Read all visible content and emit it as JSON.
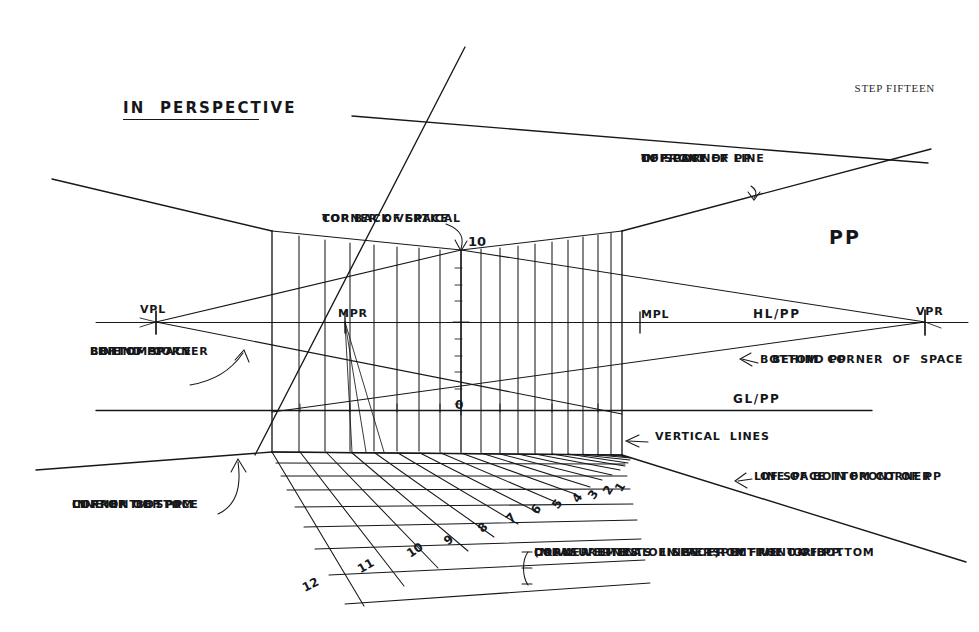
{
  "sheet": {
    "title": "IN  PERSPECTIVE",
    "step_label": "STEP FIFTEEN",
    "background_color": "#ffffff",
    "ink_color": "#15171a"
  },
  "points": {
    "vpl": {
      "label": "VPL",
      "x": 155,
      "y": 322
    },
    "vpr": {
      "label": "VPR",
      "x": 925,
      "y": 322
    },
    "mpr": {
      "label": "MPR",
      "x": 345,
      "y": 322
    },
    "mpl": {
      "label": "MPL",
      "x": 640,
      "y": 322
    }
  },
  "lines": {
    "horizon": {
      "label": "HL/PP",
      "y": 322
    },
    "ground": {
      "label": "GL/PP",
      "y": 410
    },
    "picture_plane": {
      "label": "PP"
    }
  },
  "measuring_line": {
    "top_value": "10",
    "bottom_value": "0",
    "x": 461,
    "top_y": 250,
    "bottom_y": 415
  },
  "annotations": [
    {
      "name": "top-back-vertical-corner",
      "lines": [
        "TOP BACK VERTICAL",
        "CORNER OF SPACE"
      ],
      "target_value": "10"
    },
    {
      "name": "top-corner-line-front-pp",
      "lines": [
        "TOP CORNER LINE",
        "OF SPACE",
        "IN FRONT OF PP"
      ]
    },
    {
      "name": "bottom-corner-line-behind-pp-left",
      "lines": [
        "BOTTOM CORNER",
        "LINE OF SPACE",
        "BEHIND PP"
      ]
    },
    {
      "name": "bottom-corner-space-behind-pp-right",
      "lines": [
        "BOTTOM  CORNER  OF  SPACE",
        "BEHIND PP"
      ]
    },
    {
      "name": "vertical-lines",
      "lines": [
        "VERTICAL  LINES"
      ]
    },
    {
      "name": "line-of-bottom-corner-front-pp-right",
      "lines": [
        "LINE OF BOTTOM CORNER",
        "OF SPACE IN FRONT OF PP"
      ]
    },
    {
      "name": "line-of-bottom-corner-front-pp-left",
      "lines": [
        "LINE OF  BOTTOM",
        "CORNER OF SPACE",
        "IN FRONT OF PP"
      ]
    }
  ],
  "instruction": {
    "lines": [
      "DRAW  VERTICAL  LINES  FROM  THE  GRID",
      "(MEASUREMENTS  IN  PERSPECTIVE  ON  BOTTOM",
      "CORNER  LINES  OF SPACE)  IN FRONT OF PP."
    ]
  },
  "grid_numbers": [
    {
      "value": "1",
      "x": 612,
      "y": 487,
      "rot": -58
    },
    {
      "value": "2",
      "x": 600,
      "y": 490,
      "rot": -58
    },
    {
      "value": "3",
      "x": 585,
      "y": 494,
      "rot": -56
    },
    {
      "value": "4",
      "x": 569,
      "y": 497,
      "rot": -54
    },
    {
      "value": "5",
      "x": 549,
      "y": 503,
      "rot": -52
    },
    {
      "value": "6",
      "x": 528,
      "y": 508,
      "rot": -50
    },
    {
      "value": "7",
      "x": 503,
      "y": 516,
      "rot": -46
    },
    {
      "value": "8",
      "x": 475,
      "y": 525,
      "rot": -42
    },
    {
      "value": "9",
      "x": 441,
      "y": 537,
      "rot": -38
    },
    {
      "value": "10",
      "x": 404,
      "y": 549,
      "rot": -34
    },
    {
      "value": "11",
      "x": 355,
      "y": 564,
      "rot": -30
    },
    {
      "value": "12",
      "x": 300,
      "y": 582,
      "rot": -26
    }
  ],
  "chart_data": {
    "type": "diagram",
    "key_points": [
      {
        "name": "VPL",
        "x": 155,
        "y": 322
      },
      {
        "name": "MPR",
        "x": 345,
        "y": 322
      },
      {
        "name": "MPL",
        "x": 640,
        "y": 322
      },
      {
        "name": "VPR",
        "x": 925,
        "y": 322
      }
    ],
    "reference_lines": [
      {
        "name": "HL/PP",
        "type": "horizontal",
        "y": 322
      },
      {
        "name": "GL/PP",
        "type": "horizontal",
        "y": 410
      }
    ],
    "vertical_span": {
      "left_x": 270,
      "right_x": 622,
      "top_y": 230,
      "bottom_y": 455
    },
    "grid_divisions": 12
  }
}
